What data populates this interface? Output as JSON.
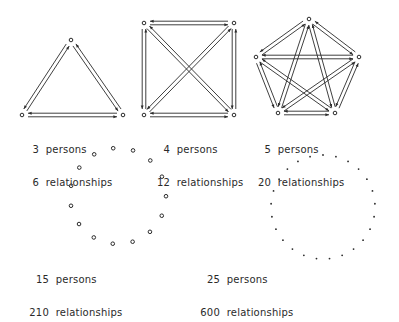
{
  "diagrams": [
    {
      "id": "three",
      "persons": "3",
      "persons_label": "persons",
      "relationships": "6",
      "relationships_label": "relationships"
    },
    {
      "id": "four",
      "persons": "4",
      "persons_label": "persons",
      "relationships": "12",
      "relationships_label": "relationships"
    },
    {
      "id": "five",
      "persons": "5",
      "persons_label": "persons",
      "relationships": "20",
      "relationships_label": "relationships"
    },
    {
      "id": "fifteen",
      "persons": "15",
      "persons_label": "persons",
      "relationships": "210",
      "relationships_label": "relationships"
    },
    {
      "id": "twentyfive",
      "persons": "25",
      "persons_label": "persons",
      "relationships": "600",
      "relationships_label": "relationships"
    }
  ],
  "colors": {
    "ink": "#2a2a2a",
    "background": "#ffffff"
  }
}
